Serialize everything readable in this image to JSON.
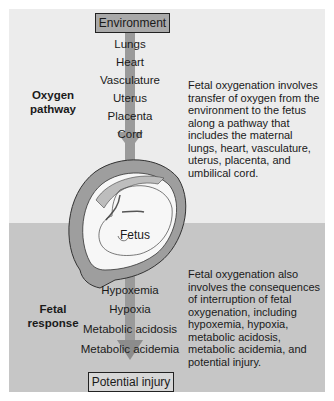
{
  "diagram": {
    "top_box": "Environment",
    "bottom_box": "Potential injury",
    "oxygen_pathway": {
      "label_line1": "Oxygen",
      "label_line2": "pathway",
      "steps": [
        "Lungs",
        "Heart",
        "Vasculature",
        "Uterus",
        "Placenta",
        "Cord"
      ],
      "description": "Fetal oxygenation involves transfer of oxygen from the environment to the fetus along a pathway that includes the maternal lungs, heart,  vasculature, uterus, placenta, and umbilical cord."
    },
    "fetus_label": "Fetus",
    "fetal_response": {
      "label_line1": "Fetal",
      "label_line2": "response",
      "steps": [
        "Hypoxemia",
        "Hypoxia",
        "Metabolic acidosis",
        "Metabolic acidemia"
      ],
      "description": "Fetal oxygenation also involves the consequences of interruption of fetal oxygenation, including hypoxemia, hypoxia, metabolic acidosis, metabolic acidemia, and potential injury."
    },
    "colors": {
      "top_band": "#ececec",
      "bottom_band": "#c6c6c6",
      "arrow": "#9a9a9a",
      "environment_box": "#a9a9a9"
    }
  }
}
